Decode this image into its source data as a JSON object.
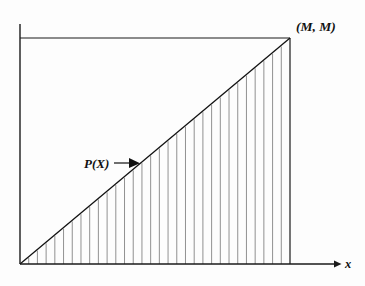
{
  "figure": {
    "name": "cumulative-distribution-triangle-plot",
    "background_color": "#fdfdfd",
    "ink_color": "#111111",
    "hatch_color": "#7d7d7d"
  },
  "labels": {
    "corner_point": "(M, M)",
    "curve_label": "P(X)",
    "x_axis": "x"
  },
  "chart_data": {
    "type": "line",
    "title": "",
    "subtitle": "",
    "xlabel": "x",
    "ylabel": "",
    "grid": false,
    "legend": null,
    "xlim": [
      0,
      1
    ],
    "ylim": [
      0,
      1
    ],
    "series": [
      {
        "name": "P(X)",
        "x": [
          0,
          1
        ],
        "values": [
          0,
          1
        ],
        "description": "straight line from origin to the point (M, M)"
      }
    ],
    "annotations": [
      {
        "text": "(M, M)",
        "x": 1,
        "y": 1,
        "placement": "above-right of apex"
      },
      {
        "text": "P(X)",
        "x": 0.43,
        "y": 0.43,
        "placement": "left of line, with right-pointing arrow"
      },
      {
        "text": "x",
        "x": 1.2,
        "y": 0,
        "placement": "end of x-axis"
      }
    ],
    "shading": {
      "style": "vertical-hatch",
      "region": "area under the line from x=0 to x=M down to the x-axis",
      "line_count": 30
    },
    "frame": {
      "top_line": true,
      "right_line": true,
      "y_axis": true,
      "x_axis_arrow": true
    }
  }
}
